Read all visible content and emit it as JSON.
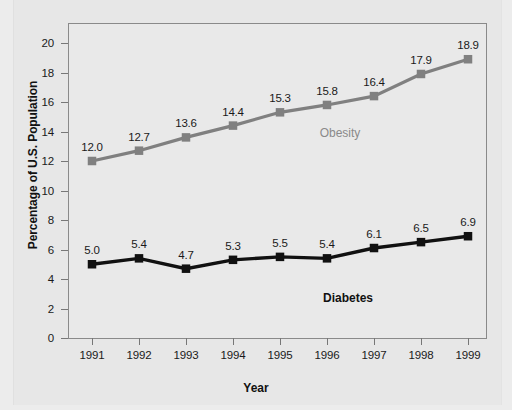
{
  "chart_data": {
    "type": "line",
    "title": "",
    "xlabel": "Year",
    "ylabel": "Percentage of U.S. Population",
    "categories": [
      "1991",
      "1992",
      "1993",
      "1994",
      "1995",
      "1996",
      "1997",
      "1998",
      "1999"
    ],
    "ylim": [
      0,
      20
    ],
    "y_ticks": [
      "0",
      "2",
      "4",
      "6",
      "8",
      "10",
      "12",
      "14",
      "16",
      "18",
      "20"
    ],
    "grid": false,
    "legend_position": "inline-labels",
    "series": [
      {
        "name": "Obesity",
        "color": "#808080",
        "marker": "square",
        "values": [
          12.0,
          12.7,
          13.6,
          14.4,
          15.3,
          15.8,
          16.4,
          17.9,
          18.9
        ],
        "labels": [
          "12.0",
          "12.7",
          "13.6",
          "14.4",
          "15.3",
          "15.8",
          "16.4",
          "17.9",
          "18.9"
        ]
      },
      {
        "name": "Diabetes",
        "color": "#111111",
        "marker": "square",
        "values": [
          5.0,
          5.4,
          4.7,
          5.3,
          5.5,
          5.4,
          6.1,
          6.5,
          6.9
        ],
        "labels": [
          "5.0",
          "5.4",
          "4.7",
          "5.3",
          "5.5",
          "5.4",
          "6.1",
          "6.5",
          "6.9"
        ]
      }
    ]
  },
  "figure": {
    "background_color": "#e7e7e7",
    "plot_border_color": "#8a8a8a"
  }
}
